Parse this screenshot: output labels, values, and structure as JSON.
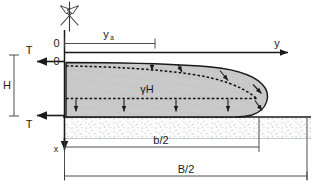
{
  "figure": {
    "type": "engineering-cross-section",
    "background_color": "#ffffff",
    "body_fill_color": "#c9c9c9",
    "line_color": "#1a1a1a",
    "soil_fill_color": "#fbfbfb",
    "soil_speckle_color": "#9aa0a6"
  },
  "axes": {
    "horizontal_axis_label": "y",
    "vertical_axis_label": "x",
    "origin_upper_label": "0",
    "origin_lower_label": "0"
  },
  "labels": {
    "shear_top": "T",
    "shear_bottom": "T",
    "thickness": "H",
    "body_stress": "γH",
    "spread_distance": "y",
    "spread_distance_subscript": "a",
    "half_width_inner": "b/2",
    "half_width_outer": "B/2"
  },
  "dimensions": [
    {
      "name": "spread-distance",
      "label": "y",
      "subscript": "a",
      "orientation": "horizontal",
      "position": "top"
    },
    {
      "name": "slab-thickness",
      "label": "H",
      "subscript": "",
      "orientation": "vertical",
      "position": "left"
    },
    {
      "name": "inner-half-width",
      "label": "b/2",
      "subscript": "",
      "orientation": "horizontal",
      "position": "bottom-upper"
    },
    {
      "name": "outer-half-width",
      "label": "B/2",
      "subscript": "",
      "orientation": "horizontal",
      "position": "bottom-lower"
    }
  ],
  "symbols": {
    "symmetry_axis_marker": "crossed-arrows-symbol",
    "shear_arrow_left_top": "arrow-left",
    "shear_arrow_left_bottom": "arrow-left",
    "axis_arrow_right": "arrow-right",
    "axis_arrow_down": "arrow-down",
    "load_arrows_count": 5,
    "normal_arrows_count": 4
  }
}
